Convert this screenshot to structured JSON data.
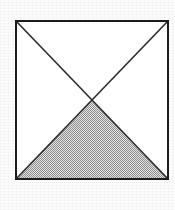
{
  "figure": {
    "title": "Square with both diagonals drawn and lower triangle shaded",
    "description": "A square outline with its two diagonals intersecting at the center, dividing it into four triangles; the bottom triangle is filled with a dithered gray halftone.",
    "background_color": "#fcfcfc",
    "interior_color": "#ffffff",
    "outline_color": "#1c1c1c",
    "diagonal_color": "#2b2b2b",
    "shade_color": "#b4b4b4",
    "shade_pattern": "dither-checkerboard",
    "outline_width_px": 2,
    "diagonal_width_px": 1.6
  },
  "chart_data": {
    "type": "scatter",
    "title": "Square with both diagonals drawn and lower triangle shaded",
    "xlabel": "",
    "ylabel": "",
    "grid": false,
    "legend": false,
    "xlim": [
      16,
      168
    ],
    "ylim": [
      21,
      179
    ],
    "shapes": [
      {
        "name": "square-outline",
        "kind": "polygon",
        "closed": true,
        "fill": "#ffffff",
        "stroke": "#1c1c1c",
        "stroke_width": 2,
        "points": [
          [
            16,
            21
          ],
          [
            168,
            21
          ],
          [
            168,
            179
          ],
          [
            16,
            179
          ]
        ]
      },
      {
        "name": "shaded-bottom-triangle",
        "kind": "polygon",
        "closed": true,
        "fill": "#b4b4b4",
        "fill_pattern": "dither-checkerboard",
        "stroke": "none",
        "points": [
          [
            92,
            100
          ],
          [
            168,
            179
          ],
          [
            16,
            179
          ]
        ]
      },
      {
        "name": "diagonal-top-left-to-bottom-right",
        "kind": "line",
        "stroke": "#2b2b2b",
        "stroke_width": 1.6,
        "points": [
          [
            16,
            21
          ],
          [
            168,
            179
          ]
        ]
      },
      {
        "name": "diagonal-top-right-to-bottom-left",
        "kind": "line",
        "stroke": "#2b2b2b",
        "stroke_width": 1.6,
        "points": [
          [
            168,
            21
          ],
          [
            16,
            179
          ]
        ]
      }
    ],
    "points": [
      {
        "name": "vertex-top-left",
        "x": 16,
        "y": 21
      },
      {
        "name": "vertex-top-right",
        "x": 168,
        "y": 21
      },
      {
        "name": "vertex-bottom-right",
        "x": 168,
        "y": 179
      },
      {
        "name": "vertex-bottom-left",
        "x": 16,
        "y": 179
      },
      {
        "name": "diagonal-intersection-center",
        "x": 92,
        "y": 100
      }
    ],
    "annotations": []
  }
}
